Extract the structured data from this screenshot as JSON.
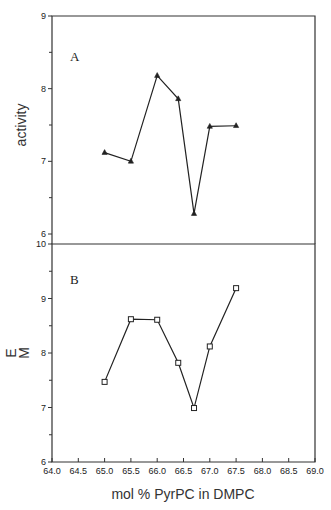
{
  "chart_data": [
    {
      "type": "line",
      "panel_label": "A",
      "title": "",
      "xlabel": "mol % PyrPC in DMPC",
      "ylabel": "activity",
      "xlim": [
        64.0,
        69.0
      ],
      "ylim": [
        6,
        9
      ],
      "y_ticks": [
        6,
        7,
        8,
        9
      ],
      "y_minor_ticks": [
        6.5,
        7.5,
        8.5
      ],
      "grid": false,
      "legend": null,
      "marker": "filled-triangle",
      "series": [
        {
          "name": "activity",
          "x": [
            65.0,
            65.5,
            66.0,
            66.4,
            66.7,
            67.0,
            67.5
          ],
          "values": [
            7.12,
            7.0,
            8.18,
            7.86,
            6.28,
            7.48,
            7.49
          ]
        }
      ]
    },
    {
      "type": "line",
      "panel_label": "B",
      "title": "",
      "xlabel": "mol % PyrPC in DMPC",
      "ylabel": "E\nM",
      "ylabel_lines": [
        "E",
        "M"
      ],
      "xlim": [
        64.0,
        69.0
      ],
      "ylim": [
        6,
        10
      ],
      "y_ticks": [
        6,
        7,
        8,
        9,
        10
      ],
      "y_minor_ticks": [
        6.5,
        7.5,
        8.5,
        9.5
      ],
      "x_ticks": [
        64.0,
        64.5,
        65.0,
        65.5,
        66.0,
        66.5,
        67.0,
        67.5,
        68.0,
        68.5,
        69.0
      ],
      "x_tick_labels": [
        "64.0",
        "64.5",
        "65.0",
        "65.5",
        "66.0",
        "66.5",
        "67.0",
        "67.5",
        "68.0",
        "68.5",
        "69.0"
      ],
      "grid": false,
      "legend": null,
      "marker": "open-square",
      "series": [
        {
          "name": "E_M",
          "x": [
            65.0,
            65.5,
            66.0,
            66.4,
            66.7,
            67.0,
            67.5
          ],
          "values": [
            7.47,
            8.62,
            8.61,
            7.82,
            6.99,
            8.12,
            9.19
          ]
        }
      ]
    }
  ],
  "labels": {
    "panel_a": "A",
    "panel_b": "B",
    "ylabel_a": "activity",
    "ylabel_b_line1": "E",
    "ylabel_b_line2": "M",
    "xlabel": "mol % PyrPC in DMPC"
  }
}
